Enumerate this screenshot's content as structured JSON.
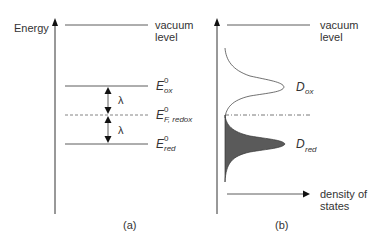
{
  "panel_a": {
    "axis_label": "Energy",
    "vacuum_label_line1": "vacuum",
    "vacuum_label_line2": "level",
    "levels": [
      {
        "name": "E_ox",
        "symbol": "E",
        "superscript": "0",
        "subscript": "ox",
        "style": "solid"
      },
      {
        "name": "E_F_redox",
        "symbol": "E",
        "superscript": "0",
        "subscript": "F, redox",
        "style": "dashed"
      },
      {
        "name": "E_red",
        "symbol": "E",
        "superscript": "0",
        "subscript": "red",
        "style": "solid"
      }
    ],
    "gap_upper": "λ",
    "gap_lower": "λ",
    "caption": "(a)"
  },
  "panel_b": {
    "vacuum_label_line1": "vacuum",
    "vacuum_label_line2": "level",
    "dox_symbol": "D",
    "dox_subscript": "ox",
    "dred_symbol": "D",
    "dred_subscript": "red",
    "x_label_line1": "density of",
    "x_label_line2": "states",
    "caption": "(b)",
    "fill_color": "#5a5a5a"
  }
}
